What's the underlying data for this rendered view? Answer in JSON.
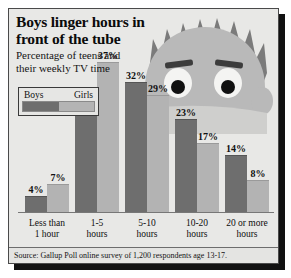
{
  "figure": {
    "title_lines": [
      "Boys linger hours in",
      "front of the tube"
    ],
    "subtitle_lines": [
      "Percentage of teens and",
      "their weekly TV time"
    ],
    "source": "Source: Gallup Poll online survey of 1,200 respondents age 13-17.",
    "illustration": "boy-watching-tv-face-icon",
    "colors": {
      "background": "#e8e8e6",
      "border": "#4a4a4a",
      "boys_bar": "#6e6e6e",
      "girls_bar": "#b3b3b3",
      "shadow": "#111111",
      "text": "#111111"
    }
  },
  "legend": {
    "entries": [
      {
        "label": "Boys",
        "color": "#6e6e6e"
      },
      {
        "label": "Girls",
        "color": "#b3b3b3"
      }
    ]
  },
  "chart_data": {
    "type": "bar",
    "title": "Boys linger hours in front of the tube",
    "subtitle": "Percentage of teens and their weekly TV time",
    "xlabel": "",
    "ylabel": "",
    "ylim": [
      0,
      40
    ],
    "grid": false,
    "legend_position": "top-left",
    "categories": [
      "Less than 1 hour",
      "1-5 hours",
      "5-10 hours",
      "10-20 hours",
      "20 or more hours"
    ],
    "category_lines": [
      [
        "Less than",
        "1 hour"
      ],
      [
        "1-5",
        "hours"
      ],
      [
        "5-10",
        "hours"
      ],
      [
        "10-20",
        "hours"
      ],
      [
        "20 or more",
        "hours"
      ]
    ],
    "series": [
      {
        "name": "Boys",
        "color": "#6e6e6e",
        "values": [
          4,
          27,
          32,
          23,
          14
        ],
        "labels": [
          "4%",
          "27%",
          "32%",
          "23%",
          "14%"
        ]
      },
      {
        "name": "Girls",
        "color": "#b3b3b3",
        "values": [
          7,
          37,
          29,
          17,
          8
        ],
        "labels": [
          "7%",
          "37%",
          "29%",
          "17%",
          "8%"
        ]
      }
    ],
    "source": "Source: Gallup Poll online survey of 1,200 respondents age 13-17."
  }
}
